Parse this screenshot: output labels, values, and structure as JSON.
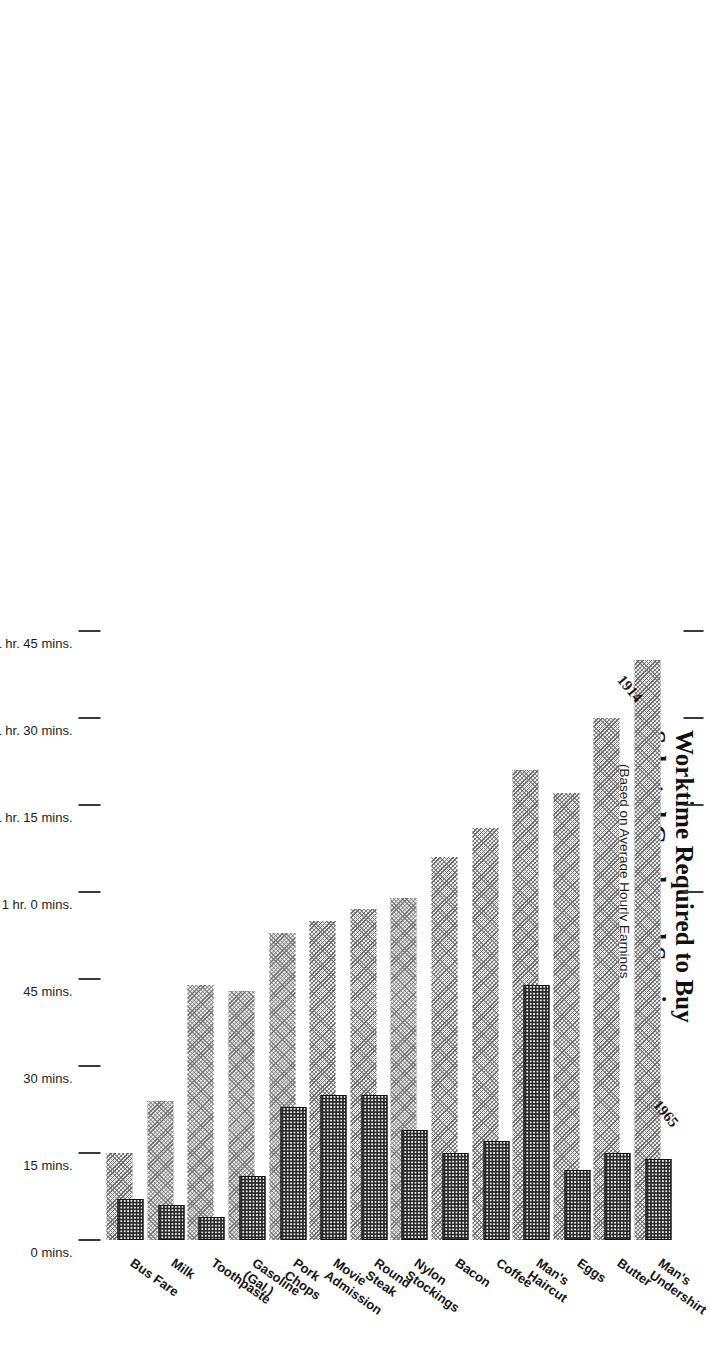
{
  "header": {
    "title_line1": "Worktime Required to Buy",
    "title_line2": "Selected Goods and Services",
    "subtitle_line1": "(Based on Average Hourly Earnings",
    "subtitle_line2": "of Factory Production Workers)"
  },
  "series_labels": {
    "older": "1914",
    "newer": "1965"
  },
  "colors": {
    "bar_1914": "#9a9a9a",
    "bar_1965": "#2a2a2a",
    "text": "#161616",
    "axis": "#3a3a3a"
  },
  "chart_data": {
    "type": "bar",
    "orientation": "horizontal",
    "title": "Worktime Required to Buy Selected Goods and Services",
    "subtitle": "(Based on Average Hourly Earnings of Factory Production Workers)",
    "xlabel": "",
    "ylabel": "",
    "grid": false,
    "legend_position": "inline-annotations",
    "value_unit": "minutes",
    "xlim": [
      0,
      105
    ],
    "tick_values": [
      0,
      15,
      30,
      45,
      60,
      75,
      90,
      105
    ],
    "tick_labels": [
      "0 mins.",
      "15 mins.",
      "30 mins.",
      "45 mins.",
      "1 hr. 0 mins.",
      "1 hr. 15 mins.",
      "1 hr. 30 mins.",
      "1 hr. 45 mins."
    ],
    "categories": [
      "Man's Undershirt",
      "Butter",
      "Eggs",
      "Man's Haircut",
      "Coffee",
      "Bacon",
      "Nylon Stockings",
      "Round Steak",
      "Movie Admission",
      "Pork Chops",
      "Gasoline (Gal.)",
      "Toothpaste",
      "Milk",
      "Bus Fare"
    ],
    "series": [
      {
        "name": "1914",
        "values": [
          100,
          90,
          77,
          81,
          71,
          66,
          59,
          57,
          55,
          53,
          43,
          44,
          24,
          15
        ]
      },
      {
        "name": "1965",
        "values": [
          14,
          15,
          12,
          44,
          17,
          15,
          19,
          25,
          25,
          23,
          11,
          4,
          6,
          7
        ]
      }
    ]
  }
}
